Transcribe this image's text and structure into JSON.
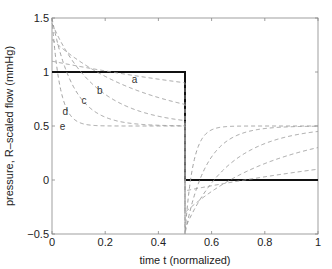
{
  "chart_data": {
    "type": "line",
    "title": "",
    "xlabel": "time t (normalized)",
    "ylabel": "pressure, R–scaled flow (mmHg)",
    "xlim": [
      0,
      1
    ],
    "ylim": [
      -0.5,
      1.5
    ],
    "xticks": [
      0,
      0.2,
      0.4,
      0.6,
      0.8,
      1
    ],
    "xtick_labels": [
      "0",
      "0.2",
      "0.4",
      "0.6",
      "0.8",
      "1"
    ],
    "yticks": [
      -0.5,
      0,
      0.5,
      1,
      1.5
    ],
    "ytick_labels": [
      "−0.5",
      "0",
      "0.5",
      "1",
      "1.5"
    ],
    "grid": false,
    "legend": "none",
    "series": [
      {
        "name": "R-scaled flow (square wave)",
        "style": "solid-thick",
        "color": "#111111",
        "x": [
          0,
          0.5,
          0.5,
          1
        ],
        "y": [
          1,
          1,
          0,
          0
        ]
      },
      {
        "name": "a",
        "style": "dashed",
        "color": "#999999",
        "tau": 1.23,
        "start_value": 1.1,
        "value_at_half": 0.9,
        "min_value": -0.1
      },
      {
        "name": "b",
        "style": "dashed",
        "color": "#999999",
        "tau": 0.36,
        "start_value": 1.3,
        "value_at_half": 0.7,
        "min_value": -0.3
      },
      {
        "name": "c",
        "style": "dashed",
        "color": "#999999",
        "tau": 0.17,
        "start_value": 1.45,
        "value_at_half": 0.55,
        "min_value": -0.45
      },
      {
        "name": "d",
        "style": "dashed",
        "color": "#999999",
        "tau": 0.08,
        "start_value": 1.5,
        "value_at_half": 0.5,
        "min_value": -0.5
      },
      {
        "name": "e",
        "style": "dashed",
        "color": "#999999",
        "tau": 0.03,
        "start_value": 1.5,
        "value_at_half": 0.5,
        "min_value": -0.5
      }
    ],
    "annotations": [
      {
        "text": "a",
        "x": 0.31,
        "y": 0.9
      },
      {
        "text": "b",
        "x": 0.18,
        "y": 0.8
      },
      {
        "text": "c",
        "x": 0.12,
        "y": 0.7
      },
      {
        "text": "d",
        "x": 0.05,
        "y": 0.6
      },
      {
        "text": "e",
        "x": 0.04,
        "y": 0.46
      }
    ],
    "mean_value": 0.5
  }
}
